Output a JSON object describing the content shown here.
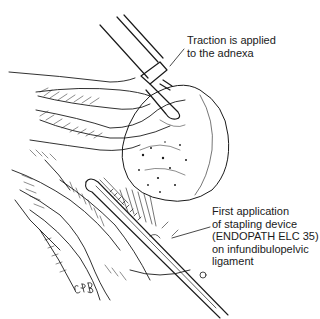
{
  "figure": {
    "type": "surgical line illustration",
    "artist_signature": "CPB"
  },
  "labels": {
    "traction": {
      "lines": [
        "Traction is applied",
        "to the adnexa"
      ]
    },
    "stapling": {
      "lines": [
        "First application",
        "of stapling device",
        "(ENDOPATH ELC 35)",
        "on infundibulopelvic",
        "ligament"
      ]
    }
  },
  "colors": {
    "ink": "#1a1a1a",
    "background": "#ffffff"
  }
}
